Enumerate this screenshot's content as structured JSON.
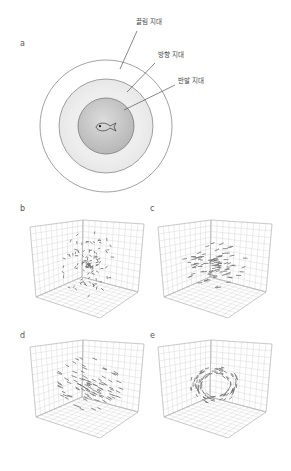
{
  "figure": {
    "panel_a": {
      "label": "a",
      "center": [
        106,
        126
      ],
      "zones": [
        {
          "name": "끌림 지대",
          "radius": 66,
          "fill": "#ffffff",
          "stroke": "#8a8a8a",
          "label_pos": [
            136,
            19
          ],
          "leader": [
            [
              137,
              31
            ],
            [
              120,
              69
            ]
          ]
        },
        {
          "name": "방향 지대",
          "radius": 47,
          "fill": "#ececec",
          "stroke": "#8a8a8a",
          "label_pos": [
            158,
            52
          ],
          "leader": [
            [
              155,
              63
            ],
            [
              127,
              92
            ]
          ]
        },
        {
          "name": "반발 지대",
          "radius": 28,
          "fill": "#c9c9c9",
          "stroke": "#7a7a7a",
          "label_pos": [
            178,
            78
          ],
          "leader": [
            [
              175,
              85
            ],
            [
              124,
              110
            ]
          ]
        }
      ],
      "center_icon": "fish-icon"
    },
    "panels": [
      {
        "label": "b",
        "label_pos": [
          21,
          207
        ],
        "origin": [
          0,
          0
        ],
        "pattern": "swarm",
        "description": "무질서한 떼 (swarm)"
      },
      {
        "label": "c",
        "label_pos": [
          151,
          207
        ],
        "origin": [
          128,
          0
        ],
        "pattern": "aligned",
        "description": "방향성 있는 무리"
      },
      {
        "label": "d",
        "label_pos": [
          21,
          334
        ],
        "origin": [
          0,
          120
        ],
        "pattern": "polarized",
        "description": "고도로 정렬된 무리"
      },
      {
        "label": "e",
        "label_pos": [
          151,
          334
        ],
        "origin": [
          128,
          120
        ],
        "pattern": "torus",
        "description": "회전하는 원환 (torus)"
      }
    ],
    "box_geometry": {
      "left_top": [
        30,
        227
      ],
      "back_top": [
        83,
        220
      ],
      "right_top": [
        144,
        224
      ],
      "left_bottom": [
        36,
        297
      ],
      "back_bottom": [
        82,
        277
      ],
      "front_bottom": [
        100,
        318
      ],
      "right_bottom": [
        138,
        292
      ],
      "grid_divisions": 10,
      "grid_color": "#cfcfcf",
      "edge_color": "#b5b5b5",
      "agent_color": "#6e6e6e"
    }
  }
}
